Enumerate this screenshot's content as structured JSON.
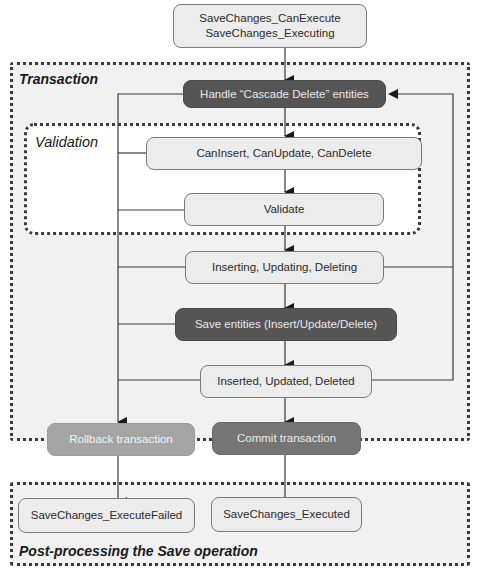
{
  "regions": {
    "transaction": {
      "label": "Transaction"
    },
    "validation": {
      "label": "Validation"
    },
    "post_processing": {
      "label": "Post-processing the Save operation"
    }
  },
  "nodes": {
    "start": {
      "label": "SaveChanges_CanExecute\nSaveChanges_Executing"
    },
    "cascade_delete": {
      "label": "Handle “Cascade Delete” entities"
    },
    "can_checks": {
      "label": "CanInsert, CanUpdate, CanDelete"
    },
    "validate": {
      "label": "Validate"
    },
    "pre_save_events": {
      "label": "Inserting, Updating, Deleting"
    },
    "save_entities": {
      "label": "Save entities (Insert/Update/Delete)"
    },
    "post_save_events": {
      "label": "Inserted, Updated, Deleted"
    },
    "rollback": {
      "label": "Rollback transaction"
    },
    "commit": {
      "label": "Commit transaction"
    },
    "execute_failed": {
      "label": "SaveChanges_ExecuteFailed"
    },
    "executed": {
      "label": "SaveChanges_Executed"
    }
  },
  "colors": {
    "region_fill": "#f1f1f1",
    "light_node": "#ececec",
    "dark_node": "#555555",
    "commit_node": "#757575",
    "rollback_node": "#a4a4a4",
    "line": "#3a3a3a"
  }
}
